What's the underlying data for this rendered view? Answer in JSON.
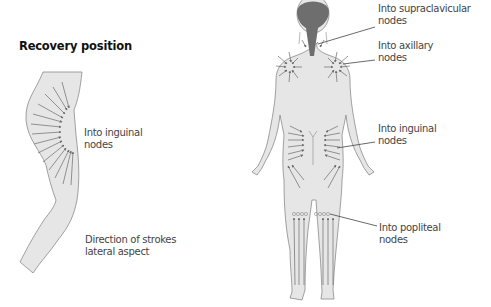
{
  "figure": {
    "title": "Recovery position",
    "left_panel": {
      "labels": [
        {
          "line1": "Into inguinal",
          "line2": "nodes"
        },
        {
          "line1": "Direction of strokes",
          "line2": "lateral aspect"
        }
      ]
    },
    "right_panel": {
      "labels": [
        {
          "line1": "Into supraclavicular",
          "line2": "nodes"
        },
        {
          "line1": "Into axillary",
          "line2": "nodes"
        },
        {
          "line1": "Into inguinal",
          "line2": "nodes"
        },
        {
          "line1": "Into popliteal",
          "line2": "nodes"
        }
      ]
    },
    "colors": {
      "body_fill": "#e6e6e6",
      "outline": "#8a8a8a",
      "arrow": "#6a6a6a",
      "hair": "#6e6e6e",
      "leader_line": "#444444"
    }
  }
}
